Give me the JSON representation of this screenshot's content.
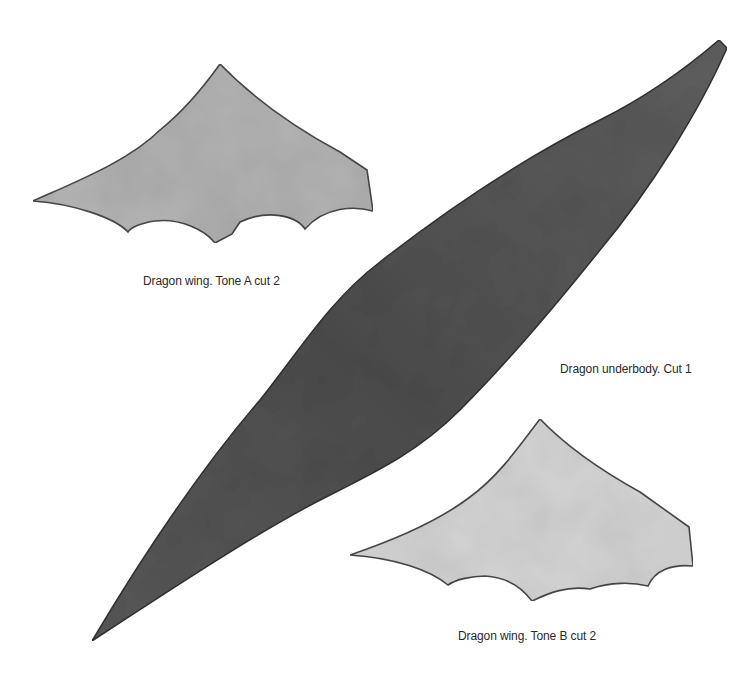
{
  "document": {
    "type": "papercraft cutout template",
    "pieces": [
      {
        "id": "wing-a",
        "label": "Dragon wing. Tone A cut 2",
        "fill": "#b4b4b4",
        "stroke": "#4a4a4a"
      },
      {
        "id": "underbody",
        "label": "Dragon underbody. Cut 1",
        "fill": "#555555",
        "stroke": "#333333"
      },
      {
        "id": "wing-b",
        "label": "Dragon wing. Tone B cut 2",
        "fill": "#d6d6d6",
        "stroke": "#4a4a4a"
      }
    ]
  }
}
